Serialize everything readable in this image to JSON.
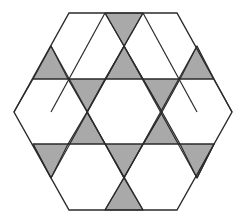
{
  "figure": {
    "colors": {
      "background": "#ffffff",
      "hexagon_fill": "#ffffff",
      "triangle_fill": "#a9a9a9",
      "stroke": "#2b2b2b"
    },
    "outline": [
      [
        69,
        13
      ],
      [
        177,
        13
      ],
      [
        232,
        112
      ],
      [
        177,
        210
      ],
      [
        69,
        210
      ],
      [
        14,
        112
      ]
    ],
    "lines": [
      [
        [
          33,
          79
        ],
        [
          214,
          79
        ]
      ],
      [
        [
          33,
          144
        ],
        [
          214,
          144
        ]
      ],
      [
        [
          105,
          13
        ],
        [
          51,
          112
        ]
      ],
      [
        [
          143,
          13
        ],
        [
          87,
          112
        ]
      ],
      [
        [
          143,
          13
        ],
        [
          197,
          112
        ]
      ],
      [
        [
          105,
          13
        ],
        [
          162,
          112
        ]
      ],
      [
        [
          51,
          46
        ],
        [
          124,
          178
        ]
      ],
      [
        [
          197,
          46
        ],
        [
          124,
          178
        ]
      ],
      [
        [
          124,
          46
        ],
        [
          51,
          178
        ]
      ],
      [
        [
          124,
          46
        ],
        [
          197,
          178
        ]
      ],
      [
        [
          87,
          112
        ],
        [
          143,
          210
        ]
      ],
      [
        [
          162,
          112
        ],
        [
          105,
          210
        ]
      ],
      [
        [
          33,
          144
        ],
        [
          51,
          178
        ]
      ],
      [
        [
          214,
          144
        ],
        [
          197,
          178
        ]
      ],
      [
        [
          14,
          112
        ],
        [
          33,
          79
        ]
      ],
      [
        [
          232,
          112
        ],
        [
          214,
          79
        ]
      ]
    ],
    "gray_triangles": [
      [
        [
          105,
          13
        ],
        [
          143,
          13
        ],
        [
          124,
          46
        ]
      ],
      [
        [
          51,
          46
        ],
        [
          33,
          79
        ],
        [
          68,
          79
        ]
      ],
      [
        [
          124,
          46
        ],
        [
          105,
          79
        ],
        [
          143,
          79
        ]
      ],
      [
        [
          197,
          46
        ],
        [
          180,
          79
        ],
        [
          214,
          79
        ]
      ],
      [
        [
          68,
          79
        ],
        [
          105,
          79
        ],
        [
          87,
          112
        ]
      ],
      [
        [
          143,
          79
        ],
        [
          180,
          79
        ],
        [
          162,
          112
        ]
      ],
      [
        [
          87,
          112
        ],
        [
          68,
          144
        ],
        [
          105,
          144
        ]
      ],
      [
        [
          162,
          112
        ],
        [
          143,
          144
        ],
        [
          180,
          144
        ]
      ],
      [
        [
          33,
          144
        ],
        [
          68,
          144
        ],
        [
          51,
          178
        ]
      ],
      [
        [
          105,
          144
        ],
        [
          143,
          144
        ],
        [
          124,
          178
        ]
      ],
      [
        [
          180,
          144
        ],
        [
          214,
          144
        ],
        [
          197,
          178
        ]
      ],
      [
        [
          124,
          178
        ],
        [
          105,
          210
        ],
        [
          143,
          210
        ]
      ]
    ],
    "counts": {
      "gray_triangles": 12,
      "white_hexagons_full": 1
    }
  }
}
